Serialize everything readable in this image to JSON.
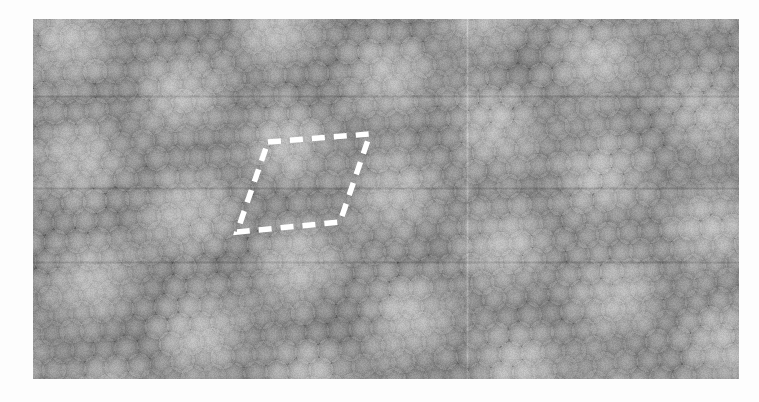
{
  "figure": {
    "kind": "atomic-resolution-micrograph",
    "caption": "",
    "background_color": "#fdfdfd"
  },
  "micrograph": {
    "name": "scanning-probe-atomic-lattice",
    "frame": {
      "x": 33,
      "y": 19,
      "width": 706,
      "height": 360
    },
    "colormap": "grayscale",
    "colors": {
      "atom_peak": "#ececec",
      "mid_tone": "#7d7d7d",
      "moire_dark": "#232323",
      "base": "#6e6e6e"
    },
    "lattice": {
      "type": "triangular",
      "atom_spacing_px": 21.2,
      "row_spacing_px": 18.4,
      "atom_radius_px": 7.6,
      "rotation_deg": -4.5
    },
    "moire_superlattice": {
      "period_px": 104,
      "row_period_px": 90,
      "rotation_deg": -5,
      "depth": 0.5
    },
    "artifacts": {
      "vertical_seam_x_px": 467,
      "horizontal_scan_lines_y_px": [
        96,
        188,
        262
      ],
      "noise_amplitude": 0.085
    }
  },
  "annotations": {
    "unit_cell": {
      "name": "moire-unit-cell",
      "label": "",
      "style": "dashed",
      "color": "#ffffff",
      "stroke_width_px": 5.5,
      "dash_px": 13,
      "gap_px": 9,
      "vertices": [
        {
          "x": 268,
          "y": 142
        },
        {
          "x": 370,
          "y": 134
        },
        {
          "x": 340,
          "y": 222
        },
        {
          "x": 237,
          "y": 232
        }
      ]
    }
  }
}
